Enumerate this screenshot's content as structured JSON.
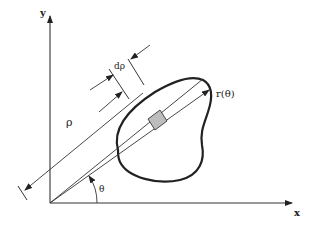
{
  "diagram": {
    "type": "polar-coordinate-area-element",
    "axes": {
      "x_label": "x",
      "y_label": "y"
    },
    "labels": {
      "radius": "ρ",
      "radius_increment": "dρ",
      "curve": "r(θ)",
      "angle": "θ"
    },
    "colors": {
      "stroke": "#222222",
      "curve": "#222222",
      "element_fill": "#bdbdbd",
      "background": "#ffffff"
    }
  }
}
